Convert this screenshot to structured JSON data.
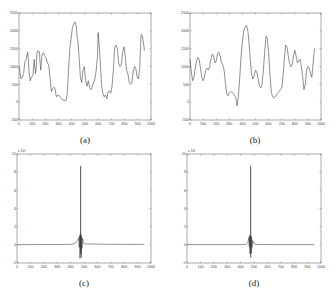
{
  "chart_data": [
    {
      "id": "a",
      "type": "line",
      "caption": "(a)",
      "title": "",
      "xlabel": "",
      "ylabel": "",
      "xlim": [
        0,
        1000
      ],
      "ylim": [
        -500,
        2500
      ],
      "xticks": [
        0,
        100,
        200,
        300,
        400,
        500,
        600,
        700,
        800,
        900,
        1000
      ],
      "yticks": [
        -500,
        0,
        500,
        1000,
        1500,
        2000,
        2500
      ],
      "y_multiplier": "",
      "grid": false,
      "series": [
        {
          "name": "noisy signal",
          "x": [
            0,
            5,
            15,
            25,
            35,
            45,
            55,
            65,
            70,
            75,
            85,
            95,
            105,
            115,
            125,
            130,
            135,
            145,
            155,
            160,
            165,
            175,
            185,
            195,
            205,
            215,
            225,
            235,
            245,
            255,
            265,
            275,
            280,
            285,
            295,
            305,
            315,
            325,
            335,
            345,
            355,
            365,
            375,
            385,
            395,
            405,
            415,
            425,
            435,
            440,
            445,
            455,
            465,
            475,
            485,
            495,
            505,
            515,
            525,
            535,
            545,
            555,
            565,
            575,
            585,
            595,
            600,
            605,
            615,
            625,
            635,
            645,
            655,
            665,
            675,
            685,
            695,
            705,
            715,
            725,
            735,
            745,
            755,
            765,
            775,
            785,
            795,
            805,
            815,
            825,
            835,
            845,
            855,
            865,
            875,
            885,
            895,
            905,
            915,
            925,
            935,
            945,
            950
          ],
          "y": [
            1000,
            900,
            650,
            700,
            800,
            1150,
            1200,
            1400,
            1250,
            900,
            600,
            700,
            750,
            1200,
            800,
            950,
            1350,
            1450,
            1400,
            1100,
            900,
            1350,
            1380,
            1300,
            1250,
            1100,
            1050,
            700,
            300,
            380,
            420,
            350,
            200,
            150,
            200,
            180,
            120,
            80,
            60,
            50,
            40,
            200,
            900,
            1500,
            1800,
            2100,
            2200,
            2250,
            2100,
            1800,
            1750,
            1300,
            700,
            550,
            900,
            1000,
            600,
            450,
            600,
            400,
            350,
            450,
            550,
            650,
            900,
            1300,
            1950,
            1700,
            1200,
            500,
            250,
            150,
            200,
            100,
            280,
            320,
            250,
            450,
            900,
            1550,
            1600,
            1500,
            1100,
            1000,
            1050,
            1400,
            1550,
            1300,
            900,
            800,
            550,
            500,
            550,
            850,
            1000,
            950,
            700,
            650,
            1000,
            1900,
            1850,
            1600,
            1450
          ]
        }
      ]
    },
    {
      "id": "b",
      "type": "line",
      "caption": "(b)",
      "title": "",
      "xlabel": "",
      "ylabel": "",
      "xlim": [
        0,
        1000
      ],
      "ylim": [
        -500,
        2500
      ],
      "xticks": [
        0,
        100,
        200,
        300,
        400,
        500,
        600,
        700,
        800,
        900,
        1000
      ],
      "yticks": [
        -500,
        0,
        500,
        1000,
        1500,
        2000,
        2500
      ],
      "y_multiplier": "",
      "grid": false,
      "series": [
        {
          "name": "smoothed signal",
          "x": [
            0,
            10,
            20,
            30,
            40,
            50,
            60,
            70,
            80,
            90,
            100,
            110,
            120,
            130,
            140,
            150,
            160,
            170,
            180,
            190,
            200,
            210,
            220,
            230,
            240,
            250,
            260,
            270,
            280,
            290,
            300,
            310,
            320,
            330,
            340,
            350,
            360,
            370,
            380,
            390,
            400,
            410,
            420,
            430,
            440,
            450,
            460,
            470,
            480,
            490,
            500,
            510,
            520,
            530,
            540,
            550,
            560,
            570,
            580,
            590,
            600,
            610,
            620,
            630,
            640,
            650,
            660,
            670,
            680,
            690,
            700,
            710,
            720,
            730,
            740,
            750,
            760,
            770,
            780,
            790,
            800,
            810,
            820,
            830,
            840,
            850,
            860,
            870,
            880,
            890,
            900,
            910,
            920,
            930,
            940,
            950
          ],
          "y": [
            1200,
            850,
            600,
            700,
            950,
            1150,
            1250,
            1200,
            950,
            700,
            600,
            700,
            900,
            950,
            900,
            1000,
            1200,
            1350,
            1300,
            1100,
            1150,
            1350,
            1400,
            1300,
            1100,
            1050,
            900,
            550,
            250,
            180,
            250,
            300,
            280,
            250,
            200,
            100,
            -100,
            200,
            700,
            1300,
            1700,
            2000,
            2100,
            2150,
            2050,
            1700,
            1200,
            800,
            650,
            750,
            900,
            850,
            650,
            450,
            400,
            500,
            900,
            1400,
            1850,
            1800,
            1400,
            800,
            300,
            150,
            120,
            150,
            200,
            250,
            300,
            350,
            400,
            700,
            1200,
            1600,
            1550,
            1300,
            1100,
            1000,
            1050,
            1300,
            1450,
            1300,
            1100,
            1150,
            1200,
            1000,
            700,
            350,
            500,
            900,
            1000,
            950,
            800,
            700,
            1100,
            1500
          ]
        }
      ]
    },
    {
      "id": "c",
      "type": "line",
      "caption": "(c)",
      "title": "",
      "xlabel": "",
      "ylabel": "",
      "xlim": [
        0,
        1000
      ],
      "ylim": [
        -2,
        10
      ],
      "xticks": [
        0,
        100,
        200,
        300,
        400,
        500,
        600,
        700,
        800,
        900,
        1000
      ],
      "yticks": [
        -2,
        0,
        2,
        4,
        6,
        8,
        10
      ],
      "y_multiplier": "x 10^7",
      "grid": false,
      "series": [
        {
          "name": "autocorrelation",
          "x": [
            0,
            100,
            200,
            300,
            400,
            420,
            440,
            455,
            460,
            465,
            468,
            470,
            472,
            474,
            475,
            476,
            478,
            480,
            482,
            485,
            490,
            495,
            500,
            510,
            520,
            540,
            560,
            600,
            700,
            800,
            900,
            950
          ],
          "y": [
            0.02,
            0.02,
            0.03,
            0.04,
            0.05,
            0.1,
            0.25,
            0.6,
            0.8,
            -0.3,
            1.0,
            -1.5,
            1.2,
            -0.8,
            8.7,
            -1.0,
            1.1,
            -1.4,
            0.9,
            -0.4,
            0.7,
            0.3,
            0.15,
            0.1,
            0.1,
            0.08,
            0.1,
            0.08,
            0.06,
            0.05,
            0.05,
            0.05
          ]
        }
      ]
    },
    {
      "id": "d",
      "type": "line",
      "caption": "(d)",
      "title": "",
      "xlabel": "",
      "ylabel": "",
      "xlim": [
        0,
        1000
      ],
      "ylim": [
        -2,
        10
      ],
      "xticks": [
        0,
        100,
        200,
        300,
        400,
        500,
        600,
        700,
        800,
        900,
        1000
      ],
      "yticks": [
        -2,
        0,
        2,
        4,
        6,
        8,
        10
      ],
      "y_multiplier": "x 10^7",
      "grid": false,
      "series": [
        {
          "name": "autocorrelation",
          "x": [
            0,
            100,
            200,
            300,
            400,
            440,
            455,
            460,
            465,
            468,
            470,
            472,
            474,
            475,
            476,
            478,
            480,
            482,
            485,
            490,
            500,
            520,
            600,
            700,
            800,
            900,
            950
          ],
          "y": [
            0.02,
            0.02,
            0.02,
            0.02,
            0.02,
            0.05,
            0.3,
            0.8,
            -0.2,
            1.1,
            -1.0,
            1.0,
            -0.6,
            8.7,
            -1.4,
            1.0,
            -0.9,
            0.8,
            -0.3,
            0.5,
            0.1,
            0.05,
            0.03,
            0.02,
            0.02,
            0.02,
            0.02
          ]
        }
      ]
    }
  ],
  "panels": {
    "a": {
      "caption": "(a)"
    },
    "b": {
      "caption": "(b)"
    },
    "c": {
      "caption": "(c)",
      "multiplier": "x 10⁷"
    },
    "d": {
      "caption": "(d)",
      "multiplier": "x 10⁷"
    }
  }
}
